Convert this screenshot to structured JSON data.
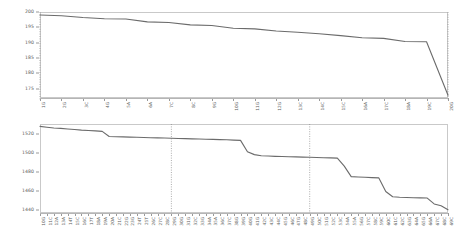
{
  "figure": {
    "background": "#ffffff",
    "line_color": "#6b6b6b",
    "axis_color": "#c9c9c9",
    "reference_line_color": "#8a8a8a",
    "panel_count": 2
  },
  "chart_data": [
    {
      "type": "line",
      "panel": "top",
      "title": "",
      "subtitle": "",
      "xlabel": "",
      "ylabel": "",
      "grid": false,
      "legend": null,
      "ylim": [
        172,
        200
      ],
      "yticks": [
        175,
        180,
        185,
        190,
        195,
        200
      ],
      "ytick_labels": [
        "175",
        "180",
        "185",
        "190",
        "195",
        "200"
      ],
      "categories": [
        "1G",
        "2G",
        "3C",
        "4G",
        "5A",
        "6A",
        "7C",
        "8C",
        "9G",
        "10G",
        "11G",
        "12G",
        "13C",
        "14C",
        "15C",
        "16A",
        "17C",
        "18A",
        "19C",
        "20G"
      ],
      "x": [
        1,
        2,
        3,
        4,
        5,
        6,
        7,
        8,
        9,
        10,
        11,
        12,
        13,
        14,
        15,
        16,
        17,
        18,
        19,
        20
      ],
      "series": [
        {
          "name": "score",
          "values": [
            199.0,
            198.8,
            198.2,
            197.8,
            197.7,
            196.8,
            196.6,
            195.8,
            195.6,
            194.7,
            194.5,
            193.8,
            193.4,
            192.9,
            192.3,
            191.6,
            191.4,
            190.4,
            190.3,
            172.9
          ]
        }
      ],
      "reference_lines": [
        {
          "orientation": "vertical",
          "at_category": "1G",
          "style": "dotted"
        },
        {
          "orientation": "vertical",
          "at_category": "20G",
          "style": "dotted"
        }
      ]
    },
    {
      "type": "line",
      "panel": "bottom",
      "title": "",
      "subtitle": "",
      "xlabel": "",
      "ylabel": "",
      "grid": false,
      "legend": null,
      "ylim": [
        1437,
        1530
      ],
      "yticks": [
        1440,
        1460,
        1480,
        1500,
        1520
      ],
      "ytick_labels": [
        "1440",
        "1460",
        "1480",
        "1500",
        "1520"
      ],
      "categories": [
        "10G",
        "11C",
        "12A",
        "13A",
        "14T",
        "15C",
        "16C",
        "17T",
        "18A",
        "19A",
        "20A",
        "21C",
        "22G",
        "23G",
        "24T",
        "25T",
        "26C",
        "27C",
        "28C",
        "29G",
        "30G",
        "31G",
        "32C",
        "33G",
        "34A",
        "35A",
        "36C",
        "37C",
        "38G",
        "39G",
        "40G",
        "41G",
        "42C",
        "43C",
        "44C",
        "45G",
        "46C",
        "47G",
        "48C",
        "49G",
        "50C",
        "51G",
        "52C",
        "53C",
        "54A",
        "55A",
        "56G",
        "57C",
        "58C",
        "59C",
        "60C",
        "61C",
        "62C",
        "63G",
        "64A",
        "65G",
        "66A",
        "67C",
        "68C",
        "69C"
      ],
      "x": [
        1,
        2,
        3,
        4,
        5,
        6,
        7,
        8,
        9,
        10,
        11,
        12,
        13,
        14,
        15,
        16,
        17,
        18,
        19,
        20,
        21,
        22,
        23,
        24,
        25,
        26,
        27,
        28,
        29,
        30,
        31,
        32,
        33,
        34,
        35,
        36,
        37,
        38,
        39,
        40,
        41,
        42,
        43,
        44,
        45,
        46,
        47,
        48,
        49,
        50,
        51,
        52,
        53,
        54,
        55,
        56,
        57,
        58,
        59,
        60
      ],
      "series": [
        {
          "name": "score",
          "values": [
            1527.5,
            1526.6,
            1525.8,
            1525.4,
            1524.8,
            1524.2,
            1523.6,
            1523.2,
            1522.8,
            1522.3,
            1516.9,
            1516.7,
            1516.5,
            1516.3,
            1516.1,
            1515.9,
            1515.7,
            1515.5,
            1515.3,
            1515.1,
            1514.9,
            1514.7,
            1514.5,
            1514.3,
            1514.1,
            1513.9,
            1513.7,
            1513.5,
            1513.2,
            1512.9,
            1501.0,
            1498.0,
            1496.8,
            1496.5,
            1496.2,
            1496.0,
            1495.8,
            1495.6,
            1495.4,
            1495.2,
            1495.0,
            1494.8,
            1494.6,
            1494.3,
            1486.0,
            1475.0,
            1474.6,
            1474.3,
            1474.0,
            1473.7,
            1459.5,
            1454.0,
            1453.5,
            1453.2,
            1453.0,
            1452.8,
            1452.6,
            1446.5,
            1444.5,
            1440.5
          ]
        }
      ],
      "reference_lines": [
        {
          "orientation": "vertical",
          "at_category": "29G",
          "style": "dotted"
        },
        {
          "orientation": "vertical",
          "at_category": "49G",
          "style": "dotted"
        }
      ]
    }
  ]
}
